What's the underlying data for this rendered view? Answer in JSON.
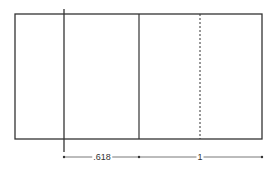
{
  "diagram": {
    "type": "golden-rectangle-subdivision",
    "colors": {
      "line": "#333333",
      "dim": "#555555",
      "background": "#ffffff"
    },
    "labels": {
      "left_segment": ".618",
      "right_segment": "1"
    },
    "lines": {
      "outer_rect": {
        "x1": 15,
        "y1": 14,
        "x2": 262,
        "y2": 139
      },
      "extended_vertical_x": 64,
      "middle_vertical_x": 139,
      "dashed_vertical_x": 200
    },
    "dimension": {
      "y": 157,
      "x_start": 64,
      "x_mid": 139,
      "x_end": 262
    }
  }
}
